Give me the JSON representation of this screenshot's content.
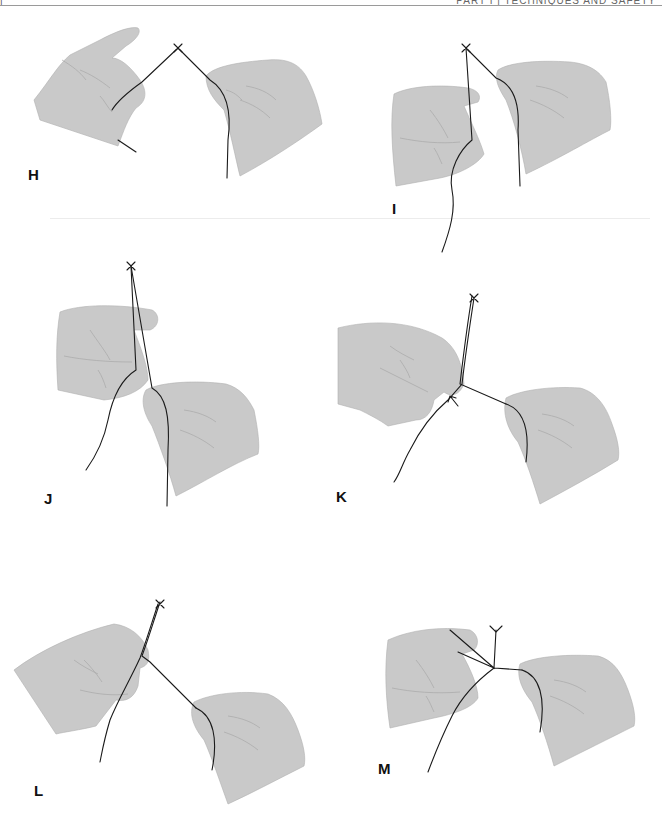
{
  "header": {
    "page_number": "|",
    "running_title": "PART I | TECHNIQUES AND SAFETY"
  },
  "panels": [
    {
      "id": "H",
      "label": "H",
      "description": "Both hands hold suture strands, needle tip at apex"
    },
    {
      "id": "I",
      "label": "I",
      "description": "Left hand lowers strand; right hand holds second strand"
    },
    {
      "id": "J",
      "label": "J",
      "description": "Strands crossed vertically between hands"
    },
    {
      "id": "K",
      "label": "K",
      "description": "Left index finger forms loop; arrow marks crossing point"
    },
    {
      "id": "L",
      "label": "L",
      "description": "Strand wrapped around left finger, drawn toward right hand"
    },
    {
      "id": "M",
      "label": "M",
      "description": "Knot completed; strands tightened between hands"
    }
  ],
  "colors": {
    "hand_fill": "#c9c9c9",
    "thread": "#1a1a1a",
    "label": "#111111",
    "header_rule": "#9a9a9a"
  }
}
